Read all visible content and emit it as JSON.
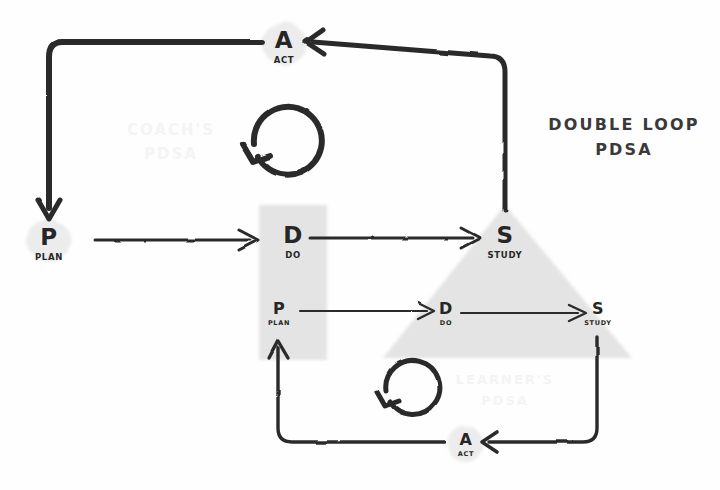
{
  "title": {
    "line1": "DOUBLE LOOP",
    "line2": "PDSA"
  },
  "watermarks": {
    "coach": {
      "line1": "COACH'S",
      "line2": "PDSA"
    },
    "learner": {
      "line1": "LEARNER'S",
      "line2": "PDSA"
    }
  },
  "colors": {
    "ink": "#2b2b2b",
    "shape_fill": "#e3e3e3",
    "blob_fill": "#ececec",
    "watermark": "#f4f4f4",
    "background": "#fefefe"
  },
  "outer_loop": {
    "name": "coachs-pdsa",
    "nodes": [
      {
        "id": "plan",
        "letter": "P",
        "sub": "PLAN",
        "shape": "circle-blob"
      },
      {
        "id": "do",
        "letter": "D",
        "sub": "DO",
        "shape": "rectangle"
      },
      {
        "id": "study",
        "letter": "S",
        "sub": "STUDY",
        "shape": "triangle"
      },
      {
        "id": "act",
        "letter": "A",
        "sub": "ACT",
        "shape": "circle-blob"
      }
    ]
  },
  "inner_loop": {
    "name": "learners-pdsa",
    "nodes": [
      {
        "id": "plan",
        "letter": "P",
        "sub": "PLAN",
        "shape": "rectangle"
      },
      {
        "id": "do",
        "letter": "D",
        "sub": "DO",
        "shape": "triangle"
      },
      {
        "id": "study",
        "letter": "S",
        "sub": "STUDY",
        "shape": "triangle"
      },
      {
        "id": "act",
        "letter": "A",
        "sub": "ACT",
        "shape": "circle-blob"
      }
    ]
  },
  "loop_markers": [
    {
      "id": "outer-cycle-arrow",
      "direction": "counterclockwise"
    },
    {
      "id": "inner-cycle-arrow",
      "direction": "counterclockwise"
    }
  ]
}
